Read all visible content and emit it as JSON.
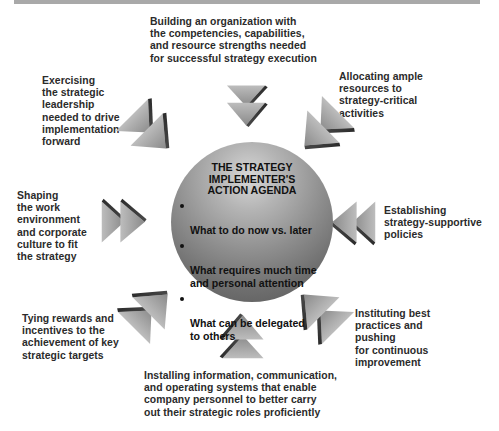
{
  "figure": {
    "top_bar_color": "#a9a9a9",
    "center": {
      "title": "THE STRATEGY\nIMPLEMENTER'S\nACTION AGENDA",
      "bullets": [
        "What to do now vs. later",
        "What requires much time\nand personal attention",
        "What can be delegated\nto others"
      ]
    },
    "nodes": {
      "top": "Building an organization with\nthe competencies, capabilities,\nand resource strengths needed\nfor successful strategy execution",
      "top_right": "Allocating ample\nresources to\nstrategy-critical\nactivities",
      "right": "Establishing\nstrategy-supportive\npolicies",
      "bottom_right": "Instituting best\npractices and\npushing\nfor continuous\nimprovement",
      "bottom": "Installing information, communication,\nand operating systems that enable\ncompany personnel to better carry\nout their strategic roles proficiently",
      "bottom_left": "Tying rewards and\nincentives to the\nachievement of key\nstrategic targets",
      "left": "Shaping\nthe work\nenvironment\nand corporate\nculture to fit\nthe strategy",
      "top_left": "Exercising\nthe strategic\nleadership\nneeded to drive\nimplementation\nforward"
    },
    "arrows": {
      "icon": "double-chevron-arrow-icon",
      "direction": "pointing toward center"
    }
  }
}
